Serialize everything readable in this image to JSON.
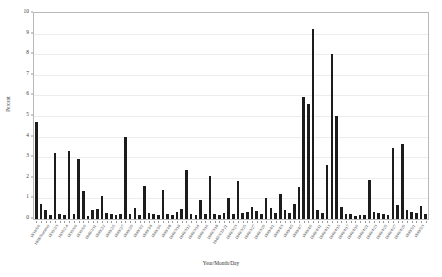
{
  "chart_data": {
    "type": "bar",
    "title": "",
    "xlabel": "Year/Month/Day",
    "ylabel": "Percent",
    "ylim": [
      0,
      10
    ],
    "ytick_labels": [
      "0",
      "1",
      "2",
      "3",
      "4",
      "5",
      "6",
      "7",
      "8",
      "9",
      "10"
    ],
    "ytick_values": [
      0,
      1,
      2,
      3,
      4,
      5,
      6,
      7,
      8,
      9,
      10
    ],
    "grid": true,
    "grid_axis": "y",
    "legend": "none",
    "bar_color": "#1c1c1c",
    "categories": [
      "1834/6/6",
      "1837/1/7",
      "1838/Summer",
      "1839/Summer",
      "1839/2/3",
      "1839/2/5",
      "1839/2-4",
      "1839/Spring",
      "1839/6/6",
      "1839/6/8",
      "1839/6/9",
      "1840/1/8",
      "1840/2/11",
      "1840/2/21",
      "1840/2/2",
      "1840/2/4",
      "1840/2/5",
      "1840/2/6",
      "1840/2/7",
      "1840/2/8",
      "1840/2/9",
      "1840/3/1",
      "1840/3/2",
      "1840/3/3",
      "1840/3/4",
      "1840/3/5",
      "1840/3/6",
      "1840/3/7",
      "1840/3/8",
      "1840/3/9",
      "1840/3/10",
      "1840/3/11",
      "1840/3/12",
      "1840/3/13",
      "1840/3/14",
      "1840/3/15",
      "1840/3/16",
      "1840/3/17",
      "1840/3/18",
      "1840/3/19",
      "1840/3/20-21",
      "1840/3/22",
      "1840/3/23",
      "1840/3/24",
      "1840/3/25",
      "1840/3/26",
      "1840/3/27",
      "1840/3/28",
      "1840/3/29",
      "1840/3/30",
      "1840/4/1",
      "1840/4/2",
      "1840/4/3",
      "1840/4/4",
      "1840/4/5",
      "1840/4/6",
      "1840/4/7",
      "1840/4/8",
      "1840/4/9",
      "1840/4/10",
      "1840/4/11",
      "1840/4/12",
      "1840/4/13",
      "1840/4/14",
      "1840/4/15",
      "1840/4/16",
      "1840/4/17",
      "1840/4/18",
      "1840/4/19",
      "1840/4/20",
      "1840/4/21",
      "1840/4/22",
      "1840/4/23",
      "1840/4/24",
      "1840/4/25",
      "1840/4/26",
      "1840/4/27",
      "1840/4/28",
      "1840/4/29",
      "1840/4/30",
      "1840/5/1",
      "1840/5/2",
      "1840/5/3",
      "1840/5/4"
    ],
    "values": [
      4.7,
      0.75,
      0.45,
      0.2,
      3.2,
      0.25,
      0.2,
      3.3,
      0.25,
      2.9,
      1.35,
      0.15,
      0.45,
      0.5,
      1.1,
      0.3,
      0.25,
      0.2,
      0.25,
      4.0,
      0.25,
      0.55,
      0.2,
      1.6,
      0.3,
      0.25,
      0.2,
      1.4,
      0.25,
      0.2,
      0.35,
      0.5,
      2.4,
      0.25,
      0.2,
      0.9,
      0.25,
      2.1,
      0.25,
      0.2,
      0.3,
      1.0,
      0.25,
      1.85,
      0.3,
      0.35,
      0.6,
      0.4,
      0.25,
      1.0,
      0.55,
      0.3,
      1.2,
      0.45,
      0.3,
      0.75,
      1.55,
      5.9,
      5.6,
      9.2,
      0.45,
      0.3,
      2.6,
      8.0,
      5.0,
      0.6,
      0.25,
      0.25,
      0.15,
      0.2,
      0.2,
      1.9,
      0.35,
      0.3,
      0.25,
      0.2,
      3.45,
      0.7,
      3.65,
      0.45,
      0.35,
      0.3,
      0.65,
      0.25
    ]
  },
  "axis": {
    "y_title": "Percent",
    "x_title": "Year/Month/Day"
  }
}
